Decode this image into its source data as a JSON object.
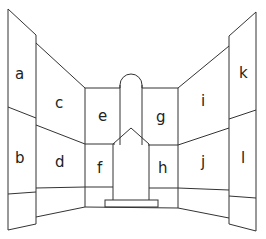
{
  "diagram": {
    "type": "room-perspective-wall-panels",
    "stroke_color": "#333333",
    "background": "#ffffff",
    "panels": [
      {
        "id": "a",
        "label": "a",
        "x": 20,
        "y": 78
      },
      {
        "id": "b",
        "label": "b",
        "x": 20,
        "y": 160
      },
      {
        "id": "c",
        "label": "c",
        "x": 59,
        "y": 108
      },
      {
        "id": "d",
        "label": "d",
        "x": 59,
        "y": 168
      },
      {
        "id": "e",
        "label": "e",
        "x": 103,
        "y": 124
      },
      {
        "id": "f",
        "label": "f",
        "x": 101,
        "y": 171
      },
      {
        "id": "g",
        "label": "g",
        "x": 161,
        "y": 124
      },
      {
        "id": "h",
        "label": "h",
        "x": 163,
        "y": 173
      },
      {
        "id": "i",
        "label": "i",
        "x": 203,
        "y": 108
      },
      {
        "id": "j",
        "label": "j",
        "x": 204,
        "y": 168
      },
      {
        "id": "k",
        "label": "k",
        "x": 243,
        "y": 78
      },
      {
        "id": "l",
        "label": "l",
        "x": 243,
        "y": 160
      }
    ]
  }
}
